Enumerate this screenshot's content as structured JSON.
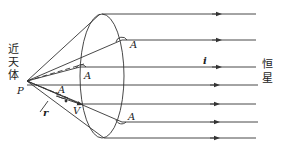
{
  "diagram": {
    "left_label_chars": [
      "近",
      "天",
      "体"
    ],
    "right_label_chars": [
      "恒",
      "星"
    ],
    "point_label": "P",
    "vector_r_label": "r",
    "vector_i_label": "i",
    "velocity_label": "V",
    "angle_labels": [
      "A",
      "A",
      "A",
      "A"
    ],
    "colors": {
      "line": "#333333",
      "background": "#ffffff"
    }
  }
}
